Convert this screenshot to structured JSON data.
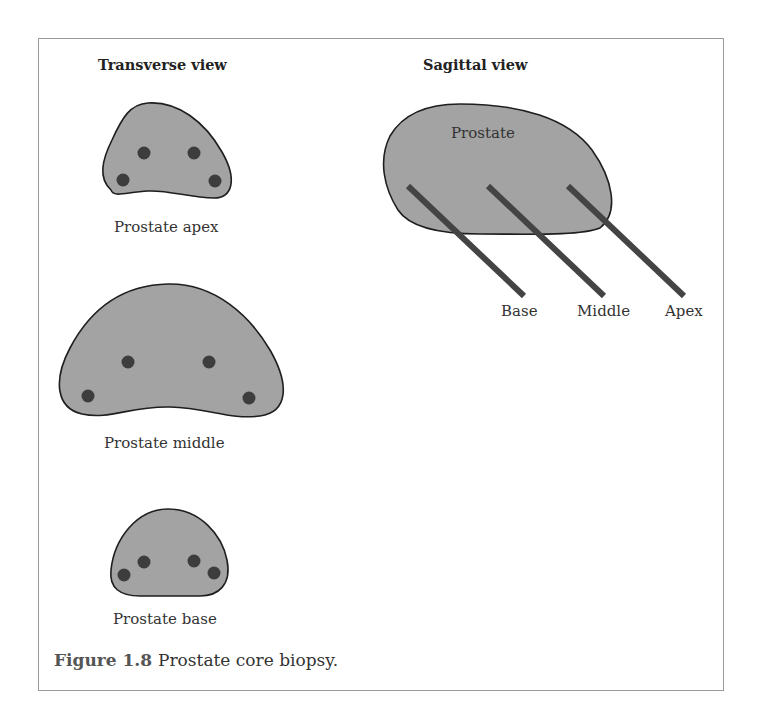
{
  "panels": {
    "transverse": {
      "heading": "Transverse view",
      "sections": [
        {
          "label": "Prostate apex"
        },
        {
          "label": "Prostate middle"
        },
        {
          "label": "Prostate base"
        }
      ]
    },
    "sagittal": {
      "heading": "Sagittal view",
      "organ_label": "Prostate",
      "needles": [
        {
          "label": "Base"
        },
        {
          "label": "Middle"
        },
        {
          "label": "Apex"
        }
      ]
    }
  },
  "caption": {
    "figure_number": "Figure 1.8",
    "text": "Prostate core biopsy."
  },
  "colors": {
    "organ_fill": "#a3a3a3",
    "organ_stroke": "#1e1e1e",
    "core_dot": "#3d3d3d",
    "needle": "#444444",
    "frame": "#9a9a9a"
  }
}
